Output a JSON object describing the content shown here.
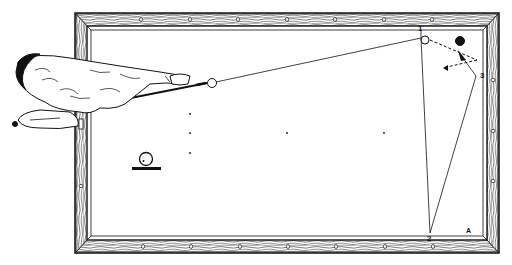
{
  "diagram": {
    "type": "billiards-shot-diagram",
    "table": {
      "rail_diamonds_top": 7,
      "rail_diamonds_bottom": 7,
      "rail_diamonds_right": 3,
      "rail_diamonds_left": 3
    },
    "labels": {
      "point_1": "1",
      "point_2": "2",
      "point_3": "3",
      "corner_A": "A"
    },
    "balls": {
      "cue_ball": "white",
      "object_ball_white": "white",
      "object_ball_red": "black"
    },
    "spin_indicator": {
      "description": "cue ball contact point diagram"
    },
    "shooter": {
      "description": "player leaning over table aiming cue"
    },
    "colors": {
      "ink": "#111111",
      "paper": "#ffffff"
    }
  }
}
